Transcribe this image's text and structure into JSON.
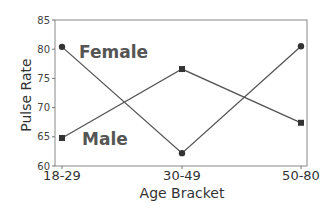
{
  "chart_data": {
    "type": "line",
    "title": "",
    "xlabel": "Age Bracket",
    "ylabel": "Pulse Rate",
    "categories": [
      "18-29",
      "30-49",
      "50-80"
    ],
    "series": [
      {
        "name": "Female",
        "marker": "circle",
        "values": [
          80.4,
          62.2,
          80.5
        ]
      },
      {
        "name": "Male",
        "marker": "square",
        "values": [
          64.8,
          76.6,
          67.4
        ]
      }
    ],
    "ylim": [
      60,
      85
    ],
    "yticks": [
      "60",
      "65",
      "70",
      "75",
      "80",
      "85"
    ],
    "grid": false,
    "legend": "inline labels",
    "colors": {
      "line": "#555555",
      "marker": "#333333",
      "axis": "#777777"
    }
  }
}
